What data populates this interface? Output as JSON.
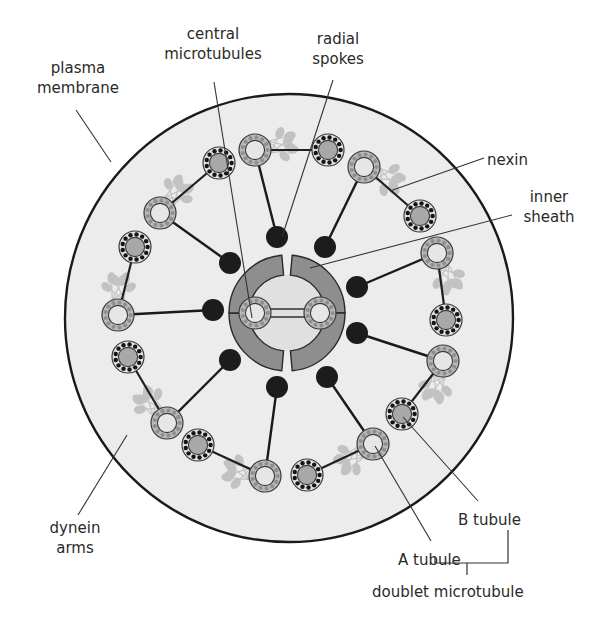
{
  "diagram": {
    "colors": {
      "background": "#ffffff",
      "cytoplasm": "#ececec",
      "membrane": "#1a1a1a",
      "a_tubule_ring": "#b9b9b9",
      "a_tubule_lumen": "#e6e6e6",
      "a_tubule_dots": "#8f8f8f",
      "b_tubule_ring": "#e3e3e3",
      "b_tubule_lumen": "#a8a8a8",
      "b_tubule_dots": "#151515",
      "spoke_head": "#1c1c1c",
      "sheath": "#8e8e8e",
      "sheath_lumen": "#e0e0e0",
      "dynein": "#c2c2c2",
      "leader": "#333333",
      "text": "#2a2a2a"
    },
    "membrane": {
      "cx": 289,
      "cy": 318,
      "r": 224
    },
    "sheath": {
      "cx": 287,
      "cy": 313,
      "r_outer": 58,
      "r_inner": 38
    },
    "central_pair": [
      {
        "cx": 255,
        "cy": 313
      },
      {
        "cx": 320,
        "cy": 313
      }
    ],
    "doublets": [
      {
        "a": [
          255,
          150
        ],
        "b": [
          219,
          163
        ]
      },
      {
        "a": [
          364,
          167
        ],
        "b": [
          328,
          150
        ]
      },
      {
        "a": [
          437,
          253
        ],
        "b": [
          420,
          216
        ]
      },
      {
        "a": [
          443,
          361
        ],
        "b": [
          446,
          320
        ]
      },
      {
        "a": [
          373,
          444
        ],
        "b": [
          402,
          414
        ]
      },
      {
        "a": [
          265,
          476
        ],
        "b": [
          307,
          475
        ]
      },
      {
        "a": [
          167,
          423
        ],
        "b": [
          198,
          445
        ]
      },
      {
        "a": [
          118,
          315
        ],
        "b": [
          128,
          357
        ]
      },
      {
        "a": [
          160,
          213
        ],
        "b": [
          135,
          247
        ]
      }
    ],
    "spoke_heads": [
      [
        277,
        237
      ],
      [
        325,
        247
      ],
      [
        357,
        287
      ],
      [
        357,
        333
      ],
      [
        327,
        377
      ],
      [
        277,
        387
      ],
      [
        230,
        360
      ],
      [
        213,
        310
      ],
      [
        230,
        263
      ]
    ]
  },
  "labels": {
    "plasma_membrane": {
      "lines": [
        "plasma",
        "membrane"
      ],
      "x": 23,
      "y": 58,
      "w": 110
    },
    "central_microtubules": {
      "lines": [
        "central",
        "microtubules"
      ],
      "x": 148,
      "y": 24,
      "w": 130
    },
    "radial_spokes": {
      "lines": [
        "radial",
        "spokes"
      ],
      "x": 300,
      "y": 29,
      "w": 76
    },
    "nexin": {
      "lines": [
        "nexin"
      ],
      "x": 487,
      "y": 150,
      "w": 60
    },
    "inner_sheath": {
      "lines": [
        "inner",
        "sheath"
      ],
      "x": 514,
      "y": 187,
      "w": 70
    },
    "dynein_arms": {
      "lines": [
        "dynein",
        "arms"
      ],
      "x": 30,
      "y": 518,
      "w": 90
    },
    "b_tubule": {
      "lines": [
        "B tubule"
      ],
      "x": 458,
      "y": 510,
      "w": 80
    },
    "a_tubule": {
      "lines": [
        "A tubule"
      ],
      "x": 398,
      "y": 550,
      "w": 80
    },
    "doublet_microtubule": {
      "lines": [
        "doublet microtubule"
      ],
      "x": 372,
      "y": 582,
      "w": 180
    }
  },
  "leaders": {
    "plasma_membrane": [
      [
        76,
        110
      ],
      [
        111,
        162
      ]
    ],
    "central_microtubules": [
      [
        214,
        82
      ],
      [
        252,
        318
      ]
    ],
    "radial_spokes": [
      [
        333,
        80
      ],
      [
        282,
        237
      ]
    ],
    "nexin": [
      [
        484,
        158
      ],
      [
        390,
        191
      ]
    ],
    "inner_sheath": [
      [
        512,
        215
      ],
      [
        310,
        268
      ]
    ],
    "dynein_arms": [
      [
        78,
        515
      ],
      [
        127,
        435
      ]
    ],
    "b_tubule": [
      [
        478,
        501
      ],
      [
        403,
        417
      ]
    ],
    "a_tubule": [
      [
        431,
        541
      ],
      [
        375,
        446
      ]
    ],
    "doublet_bracket": {
      "left_x": 435,
      "right_x": 508,
      "b_top_y": 530,
      "a_top_y": 563,
      "bar_y": 563,
      "stem_x": 467,
      "stem_bottom_y": 575
    }
  }
}
